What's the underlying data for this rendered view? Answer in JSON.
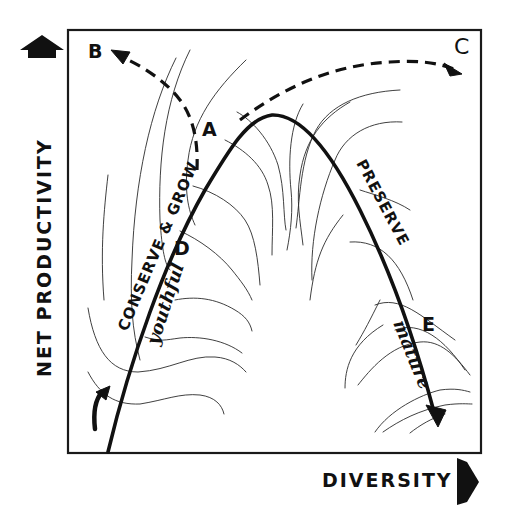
{
  "diagram": {
    "axes": {
      "y_label": "NET PRODUCTIVITY",
      "x_label": "DIVERSITY",
      "y_arrow_icon": "up-arrow-icon",
      "x_arrow_icon": "right-arrow-icon"
    },
    "main_curve": {
      "description": "succession curve rising then falling",
      "labels": {
        "rising": "CONSERVE & GROW",
        "falling": "PRESERVE"
      }
    },
    "stage_labels": {
      "youthful": "youthful",
      "mature": "mature"
    },
    "points": {
      "A": "A",
      "B": "B",
      "C": "C",
      "D": "D",
      "E": "E"
    },
    "dashed_paths": [
      {
        "from": "A",
        "to": "B"
      },
      {
        "from": "A",
        "to": "C"
      }
    ],
    "colors": {
      "ink": "#111111",
      "background": "#ffffff"
    }
  }
}
